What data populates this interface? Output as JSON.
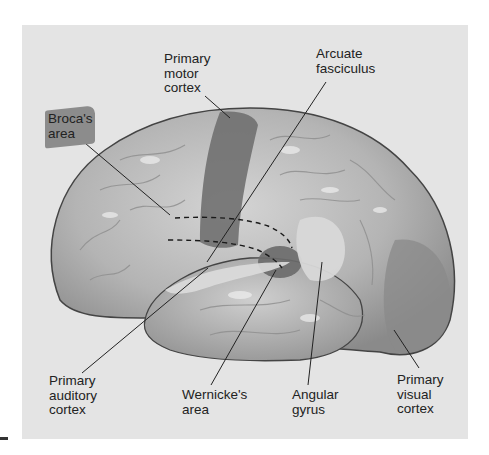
{
  "figure": {
    "type": "lateral view of left cerebral hemisphere",
    "colors": {
      "page_background": "#ffffff",
      "panel_background": "#e4e4e4",
      "cortex_base": "#b8b8b8",
      "highlighted_region": "#6e6e6e",
      "light_region": "#d2d2d2",
      "leader_line": "#222222",
      "label_text": "#222222"
    }
  },
  "labels": {
    "primary_motor_cortex": "Primary\nmotor\ncortex",
    "arcuate_fasciculus": "Arcuate\nfasciculus",
    "brocas_area": "Broca's\narea",
    "primary_auditory_cortex": "Primary\nauditory\ncortex",
    "wernickes_area": "Wernicke's\narea",
    "angular_gyrus": "Angular\ngyrus",
    "primary_visual_cortex": "Primary\nvisual\ncortex"
  }
}
